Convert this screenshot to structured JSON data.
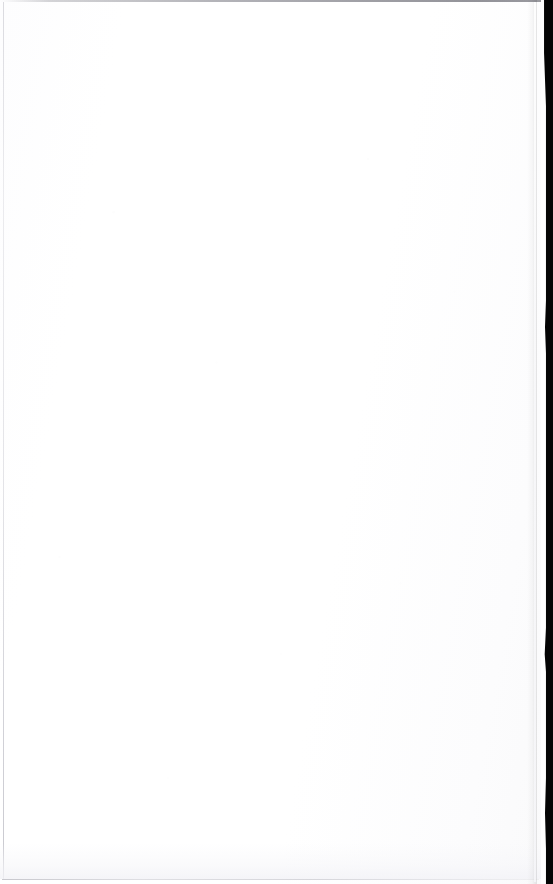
{
  "document": {
    "page_label": "",
    "body_text": "",
    "content_note": "blank page",
    "width_px": 553,
    "height_px": 884
  },
  "appearance": {
    "paper_color": "#ffffff",
    "gutter_color": "#050505",
    "edge_line_color": "#6c6c76",
    "left_rule_color": "#bebec6",
    "bottom_rule_color": "#a0a0aa"
  },
  "regions": {
    "paper_surface_name": "paper-surface",
    "top_edge_name": "top-edge-line",
    "left_edge_name": "left-edge-line",
    "bottom_edge_name": "bottom-edge-line",
    "gutter_name": "scanner-gutter-band"
  }
}
